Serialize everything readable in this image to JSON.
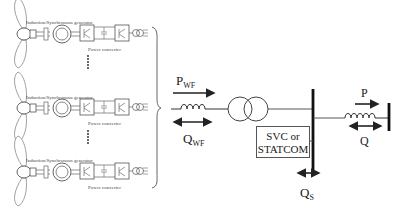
{
  "turbines": [
    {
      "generator_label": "Induction/Synchronous generator",
      "converter_label": "Power converter"
    },
    {
      "generator_label": "Induction/Synchronous generator",
      "converter_label": "Power converter"
    },
    {
      "generator_label": "Induction/Synchronous generator",
      "converter_label": "Power converter"
    }
  ],
  "ellipsis": "......",
  "wind_farm": {
    "p_label": "P",
    "p_sub": "WF",
    "q_label": "Q",
    "q_sub": "WF"
  },
  "compensator": {
    "line1": "SVC or",
    "line2": "STATCOM"
  },
  "qs": {
    "label": "Q",
    "sub": "S"
  },
  "grid": {
    "p_label": "P",
    "q_label": "Q"
  }
}
